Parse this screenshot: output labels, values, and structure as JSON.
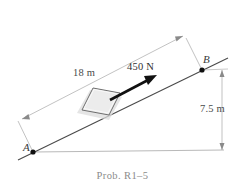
{
  "figure": {
    "caption": "Prob. R1–5",
    "background_color": "#ffffff",
    "width": 245,
    "height": 193
  },
  "diagram": {
    "type": "free-body-incline",
    "incline": {
      "start_point_label": "A",
      "end_point_label": "B",
      "length_label": "18 m",
      "length_value": 18,
      "length_units": "m",
      "rise_label": "7.5 m",
      "rise_value": 7.5,
      "rise_units": "m",
      "line_color": "#4a4a4a",
      "ground_color": "#b9b9b9"
    },
    "force": {
      "label": "450 N",
      "value": 450,
      "units": "N",
      "direction": "up the incline",
      "arrow_color": "#111111"
    },
    "block": {
      "fill_color": "#ececec",
      "edge_color": "#6e6e6e",
      "shadow_color": "#d8d8d8"
    },
    "dimension_line_color": "#9a9a9a",
    "point_marker_color": "#101010"
  },
  "labels": {
    "point_a": "A",
    "point_b": "B",
    "length": "18 m",
    "force": "450 N",
    "height": "7.5 m"
  }
}
